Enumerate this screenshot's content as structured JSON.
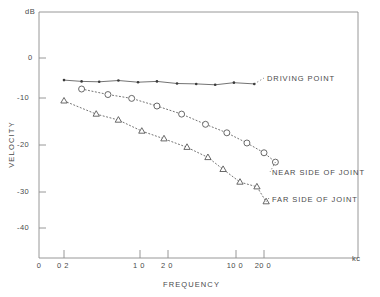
{
  "chart_data": {
    "type": "line",
    "title": "",
    "xlabel": "FREQUENCY",
    "ylabel": "VELOCITY",
    "x_unit": "kc",
    "y_unit": "dB",
    "xscale": "log",
    "xlim": [
      0.13,
      33
    ],
    "ylim": [
      -46,
      4
    ],
    "grid": false,
    "legend": "inline-right",
    "xticks": [
      0,
      0.2,
      1.0,
      2.0,
      10.0,
      20.0
    ],
    "xticklabels": [
      "0",
      "0 2",
      "1 0",
      "2 0",
      "10 0",
      "20 0"
    ],
    "yticks": [
      0,
      -10,
      -20,
      -30,
      -40
    ],
    "yticklabels": [
      "0",
      "-10",
      "-20",
      "-30",
      "-40"
    ],
    "series": [
      {
        "name": "DRIVING POINT",
        "marker": "filled-dot",
        "linestyle": "solid",
        "points": [
          {
            "x": 0.2,
            "y": -5.2
          },
          {
            "x": 0.3,
            "y": -5.5
          },
          {
            "x": 0.45,
            "y": -5.6
          },
          {
            "x": 0.7,
            "y": -5.3
          },
          {
            "x": 1.1,
            "y": -5.7
          },
          {
            "x": 1.7,
            "y": -5.5
          },
          {
            "x": 2.7,
            "y": -6.0
          },
          {
            "x": 4.2,
            "y": -6.1
          },
          {
            "x": 6.5,
            "y": -6.3
          },
          {
            "x": 10.0,
            "y": -5.8
          },
          {
            "x": 16.0,
            "y": -6.1
          }
        ]
      },
      {
        "name": "NEAR SIDE OF JOINT",
        "marker": "open-circle",
        "linestyle": "dotted",
        "points": [
          {
            "x": 0.3,
            "y": -7.3
          },
          {
            "x": 0.55,
            "y": -8.6
          },
          {
            "x": 0.95,
            "y": -9.5
          },
          {
            "x": 1.7,
            "y": -11.3
          },
          {
            "x": 3.0,
            "y": -13.2
          },
          {
            "x": 5.2,
            "y": -15.6
          },
          {
            "x": 8.5,
            "y": -17.6
          },
          {
            "x": 13.5,
            "y": -20.0
          },
          {
            "x": 20.0,
            "y": -22.3
          },
          {
            "x": 26.0,
            "y": -24.5
          }
        ]
      },
      {
        "name": "FAR SIDE OF JOINT",
        "marker": "open-triangle",
        "linestyle": "dotted",
        "points": [
          {
            "x": 0.2,
            "y": -10.1
          },
          {
            "x": 0.42,
            "y": -13.2
          },
          {
            "x": 0.7,
            "y": -14.6
          },
          {
            "x": 1.2,
            "y": -17.2
          },
          {
            "x": 2.0,
            "y": -19.0
          },
          {
            "x": 3.4,
            "y": -21.0
          },
          {
            "x": 5.5,
            "y": -23.4
          },
          {
            "x": 7.8,
            "y": -26.2
          },
          {
            "x": 11.5,
            "y": -29.2
          },
          {
            "x": 17.0,
            "y": -30.3
          },
          {
            "x": 21.0,
            "y": -33.8
          }
        ]
      }
    ]
  },
  "axes": {
    "y_unit_label": "dB",
    "x_unit_label": "kc",
    "x_axis_title": "FREQUENCY",
    "y_axis_title": "VELOCITY"
  },
  "labels": {
    "driving_point": "DRIVING POINT",
    "near_side": "NEAR SIDE OF JOINT",
    "far_side": "FAR SIDE OF JOINT"
  },
  "ticks": {
    "x": [
      {
        "label": "0",
        "px": 39
      },
      {
        "label": "0 2",
        "px": 64
      },
      {
        "label": "1 0",
        "px": 140
      },
      {
        "label": "2 0",
        "px": 168
      },
      {
        "label": "10 0",
        "px": 236
      },
      {
        "label": "20 0",
        "px": 264
      }
    ],
    "y": [
      {
        "label": "0",
        "px": 58
      },
      {
        "label": "-10",
        "px": 98
      },
      {
        "label": "-20",
        "px": 145
      },
      {
        "label": "-30",
        "px": 192
      },
      {
        "label": "-40",
        "px": 228
      }
    ]
  }
}
